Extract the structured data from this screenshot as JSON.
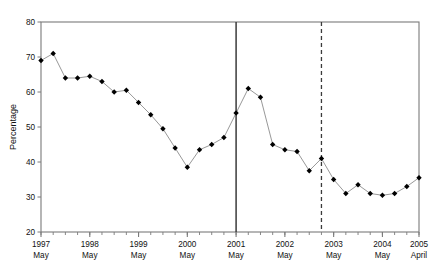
{
  "figure": {
    "top_caption": "",
    "background": "#ffffff"
  },
  "chart_data": {
    "type": "line",
    "title": "",
    "subtitle": "",
    "xlabel": "",
    "ylabel": "Percentage",
    "ylim": [
      20,
      80
    ],
    "ytick_values": [
      20,
      30,
      40,
      50,
      60,
      70,
      80
    ],
    "ytick_labels": [
      "20",
      "30",
      "40",
      "50",
      "60",
      "70",
      "80"
    ],
    "grid": false,
    "legend": null,
    "legend_position": "none",
    "marker": "filled-diamond",
    "line_color": "#8c8c8c",
    "marker_color": "#000000",
    "axis_color": "#7a7a7a",
    "xtick_labels": [
      {
        "year": "1997",
        "month": "May"
      },
      {
        "year": "1998",
        "month": "May"
      },
      {
        "year": "1999",
        "month": "May"
      },
      {
        "year": "2000",
        "month": "May"
      },
      {
        "year": "2001",
        "month": "May"
      },
      {
        "year": "2002",
        "month": "May"
      },
      {
        "year": "2003",
        "month": "May"
      },
      {
        "year": "2004",
        "month": "May"
      },
      {
        "year": "2005",
        "month": "April"
      }
    ],
    "x_axis_start": "1997 May",
    "x_axis_end": "2005 April",
    "x_interval": "quarterly",
    "x": [
      "1997 May",
      "1997 Aug",
      "1997 Nov",
      "1998 Feb",
      "1998 May",
      "1998 Aug",
      "1998 Nov",
      "1999 Feb",
      "1999 May",
      "1999 Aug",
      "1999 Nov",
      "2000 Feb",
      "2000 May",
      "2000 Aug",
      "2000 Nov",
      "2001 Feb",
      "2001 May",
      "2001 Aug",
      "2001 Nov",
      "2002 Feb",
      "2002 May",
      "2002 Aug",
      "2002 Nov",
      "2003 Feb",
      "2003 May",
      "2003 Aug",
      "2003 Nov",
      "2004 Feb",
      "2004 May",
      "2004 Aug",
      "2004 Nov",
      "2005 April"
    ],
    "values": [
      69,
      71,
      64,
      64,
      64.5,
      63,
      60,
      60.5,
      57,
      53.5,
      49.5,
      44,
      38.5,
      43.5,
      45,
      47,
      54,
      61,
      58.5,
      45,
      43.5,
      43,
      37.5,
      41,
      35,
      31,
      33.5,
      31,
      30.5,
      31,
      33,
      35.5
    ],
    "reference_lines": [
      {
        "name": "solid-marker-line",
        "style": "solid",
        "x": "2001 May"
      },
      {
        "name": "dashed-marker-line",
        "style": "dashed",
        "x": "2003 Feb"
      }
    ]
  }
}
